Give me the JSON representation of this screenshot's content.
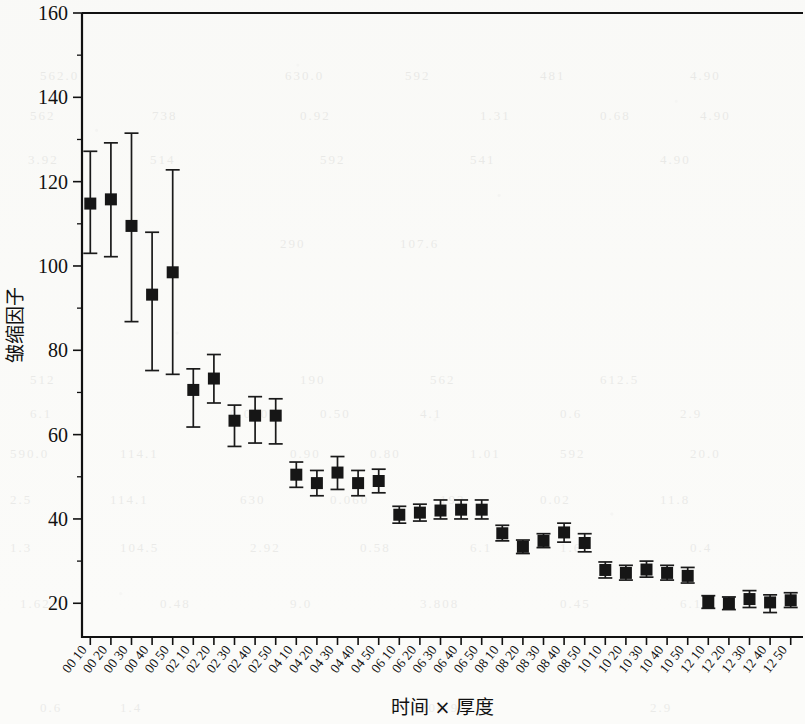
{
  "chart_data": {
    "type": "scatter",
    "title": "",
    "subtitle": "",
    "xlabel": "时间 × 厚度",
    "ylabel": "皱缩因子",
    "xlim": [
      0,
      36
    ],
    "ylim": [
      12,
      160
    ],
    "yticks": [
      20,
      40,
      60,
      80,
      100,
      120,
      140,
      160
    ],
    "ytick_labels": [
      "20",
      "40",
      "60",
      "80",
      "100",
      "120",
      "140",
      "160"
    ],
    "minor_ticks": true,
    "grid": false,
    "legend": null,
    "error_bars": "whiskers with caps (mean ± range)",
    "marker": "filled black square",
    "categories": [
      "00 10",
      "00 20",
      "00 30",
      "00 40",
      "00 50",
      "02 10",
      "02 20",
      "02 30",
      "02 40",
      "02 50",
      "04 10",
      "04 20",
      "04 30",
      "04 40",
      "04 50",
      "06 10",
      "06 20",
      "06 30",
      "06 40",
      "06 50",
      "08 10",
      "08 20",
      "08 30",
      "08 40",
      "08 50",
      "10 10",
      "10 20",
      "10 30",
      "10 40",
      "10 50",
      "12 10",
      "12 20",
      "12 30",
      "12 40",
      "12 50"
    ],
    "values": [
      114.8,
      115.8,
      109.5,
      93.2,
      98.5,
      70.6,
      73.3,
      63.3,
      64.5,
      64.5,
      50.5,
      48.5,
      51.0,
      48.5,
      49.0,
      41.0,
      41.5,
      42.0,
      42.2,
      42.2,
      36.6,
      33.4,
      34.8,
      36.8,
      34.3,
      27.9,
      27.2,
      28.0,
      27.2,
      26.5,
      20.3,
      20.0,
      21.0,
      20.2,
      20.7
    ],
    "upper": [
      127.2,
      129.2,
      131.5,
      108.0,
      122.8,
      75.6,
      79.0,
      67.0,
      69.0,
      68.5,
      53.5,
      51.5,
      54.8,
      51.5,
      51.8,
      43.0,
      43.5,
      44.5,
      44.5,
      44.5,
      38.5,
      35.0,
      36.5,
      39.0,
      36.5,
      29.8,
      29.0,
      30.0,
      29.0,
      28.5,
      21.8,
      21.5,
      23.0,
      22.0,
      22.5
    ],
    "lower": [
      103.0,
      102.2,
      86.8,
      75.2,
      74.3,
      61.8,
      67.5,
      57.2,
      58.0,
      57.8,
      47.5,
      45.5,
      47.0,
      45.5,
      46.2,
      39.0,
      39.5,
      40.0,
      40.0,
      40.0,
      34.8,
      31.8,
      33.2,
      34.5,
      32.2,
      26.0,
      25.5,
      26.2,
      25.5,
      24.8,
      18.8,
      18.5,
      19.0,
      17.8,
      19.0
    ]
  },
  "ghost_marks": [
    {
      "t": "562.0",
      "x": 40,
      "y": 68
    },
    {
      "t": "630.0",
      "x": 285,
      "y": 68
    },
    {
      "t": "592",
      "x": 405,
      "y": 68
    },
    {
      "t": "481",
      "x": 540,
      "y": 68
    },
    {
      "t": "4.90",
      "x": 690,
      "y": 68
    },
    {
      "t": "562",
      "x": 30,
      "y": 108
    },
    {
      "t": "738",
      "x": 152,
      "y": 108
    },
    {
      "t": "0.92",
      "x": 300,
      "y": 108
    },
    {
      "t": "1.31",
      "x": 480,
      "y": 108
    },
    {
      "t": "0.68",
      "x": 600,
      "y": 108
    },
    {
      "t": "4.90",
      "x": 700,
      "y": 108
    },
    {
      "t": "3.92",
      "x": 28,
      "y": 152
    },
    {
      "t": "514",
      "x": 150,
      "y": 152
    },
    {
      "t": "592",
      "x": 320,
      "y": 152
    },
    {
      "t": "541",
      "x": 470,
      "y": 152
    },
    {
      "t": "4.90",
      "x": 660,
      "y": 152
    },
    {
      "t": "290",
      "x": 280,
      "y": 236
    },
    {
      "t": "107.6",
      "x": 400,
      "y": 236
    },
    {
      "t": "512",
      "x": 30,
      "y": 372
    },
    {
      "t": "190",
      "x": 300,
      "y": 372
    },
    {
      "t": "562",
      "x": 430,
      "y": 372
    },
    {
      "t": "612.5",
      "x": 600,
      "y": 372
    },
    {
      "t": "6.1",
      "x": 30,
      "y": 406
    },
    {
      "t": "0.060",
      "x": 230,
      "y": 406
    },
    {
      "t": "0.50",
      "x": 320,
      "y": 406
    },
    {
      "t": "4.1",
      "x": 420,
      "y": 406
    },
    {
      "t": "0.6",
      "x": 560,
      "y": 406
    },
    {
      "t": "2.9",
      "x": 680,
      "y": 406
    },
    {
      "t": "590.0",
      "x": 10,
      "y": 446
    },
    {
      "t": "114.1",
      "x": 120,
      "y": 446
    },
    {
      "t": "0.90",
      "x": 290,
      "y": 446
    },
    {
      "t": "0.80",
      "x": 370,
      "y": 446
    },
    {
      "t": "1.01",
      "x": 470,
      "y": 446
    },
    {
      "t": "592",
      "x": 560,
      "y": 446
    },
    {
      "t": "20.0",
      "x": 690,
      "y": 446
    },
    {
      "t": "2.5",
      "x": 10,
      "y": 492
    },
    {
      "t": "114.1",
      "x": 110,
      "y": 492
    },
    {
      "t": "630",
      "x": 240,
      "y": 492
    },
    {
      "t": "0.060",
      "x": 330,
      "y": 492
    },
    {
      "t": "192",
      "x": 440,
      "y": 492
    },
    {
      "t": "0.02",
      "x": 540,
      "y": 492
    },
    {
      "t": "11.8",
      "x": 660,
      "y": 492
    },
    {
      "t": "1.3",
      "x": 10,
      "y": 540
    },
    {
      "t": "104.5",
      "x": 120,
      "y": 540
    },
    {
      "t": "2.92",
      "x": 250,
      "y": 540
    },
    {
      "t": "0.58",
      "x": 360,
      "y": 540
    },
    {
      "t": "6.1",
      "x": 470,
      "y": 540
    },
    {
      "t": "1.69",
      "x": 560,
      "y": 540
    },
    {
      "t": "0.4",
      "x": 690,
      "y": 540
    },
    {
      "t": "1.62",
      "x": 20,
      "y": 596
    },
    {
      "t": "0.48",
      "x": 160,
      "y": 596
    },
    {
      "t": "9.0",
      "x": 290,
      "y": 596
    },
    {
      "t": "3.808",
      "x": 420,
      "y": 596
    },
    {
      "t": "0.45",
      "x": 560,
      "y": 596
    },
    {
      "t": "6.1",
      "x": 680,
      "y": 596
    },
    {
      "t": "208.98",
      "x": 420,
      "y": 700
    },
    {
      "t": "1.4",
      "x": 120,
      "y": 700
    },
    {
      "t": "0.6",
      "x": 40,
      "y": 700
    },
    {
      "t": "2.9",
      "x": 650,
      "y": 700
    }
  ]
}
